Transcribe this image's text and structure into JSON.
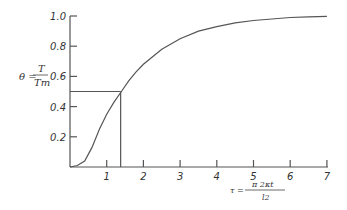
{
  "chart_data": {
    "type": "line",
    "title": "",
    "xlabel": "τ = π²κt / l²",
    "ylabel": "θ = T / Tm",
    "xlim": [
      0,
      7
    ],
    "ylim": [
      0,
      1.0
    ],
    "x_ticks": [
      "1",
      "2",
      "3",
      "4",
      "5",
      "6",
      "7"
    ],
    "y_ticks": [
      "0.2",
      "0.4",
      "0.6",
      "0.8",
      "1.0"
    ],
    "grid": false,
    "legend": null,
    "series": [
      {
        "name": "θ(τ)",
        "x": [
          0,
          0.2,
          0.4,
          0.6,
          0.8,
          1.0,
          1.2,
          1.4,
          1.6,
          1.8,
          2.0,
          2.5,
          3.0,
          3.5,
          4.0,
          4.5,
          5.0,
          5.5,
          6.0,
          6.5,
          7.0
        ],
        "y": [
          0.0,
          0.01,
          0.04,
          0.13,
          0.25,
          0.35,
          0.43,
          0.5,
          0.57,
          0.63,
          0.68,
          0.78,
          0.85,
          0.9,
          0.93,
          0.955,
          0.97,
          0.98,
          0.99,
          0.995,
          0.998
        ]
      }
    ],
    "annotations": [
      {
        "type": "reference-lines",
        "description": "horizontal line at θ=0.5 from y-axis to curve, vertical line at τ≈1.38 from curve down to x-axis",
        "x": 1.38,
        "y": 0.5
      }
    ]
  },
  "labels": {
    "y_theta": "θ =",
    "y_num": "T",
    "y_den": "Tm",
    "x_tau": "τ =",
    "x_num": "π 2κt",
    "x_den": "l2"
  }
}
